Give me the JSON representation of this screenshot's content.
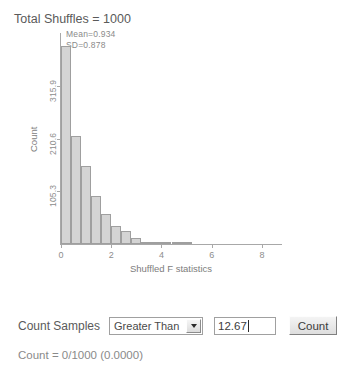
{
  "title": "Total Shuffles = 1000",
  "annotations": {
    "mean": "Mean=0.934",
    "sd": "SD=0.878"
  },
  "chart_data": {
    "type": "bar",
    "title": "Total Shuffles = 1000",
    "xlabel": "Shuffled F statistics",
    "ylabel": "Count",
    "xlim": [
      0,
      8.8
    ],
    "ylim": [
      0,
      421.2
    ],
    "grid": false,
    "legend": null,
    "xticks": [
      "0",
      "2",
      "4",
      "6",
      "8"
    ],
    "xtick_values": [
      0,
      2,
      4,
      6,
      8
    ],
    "yticks": [
      "105.3",
      "210.6",
      "315.9"
    ],
    "ytick_values": [
      105.3,
      210.6,
      315.9
    ],
    "bin_width": 0.4,
    "categories": [
      "0.0",
      "0.4",
      "0.8",
      "1.2",
      "1.6",
      "2.0",
      "2.4",
      "2.8",
      "3.2",
      "3.6",
      "4.0",
      "4.4",
      "4.8",
      "5.2",
      "5.6",
      "6.0"
    ],
    "values": [
      395,
      215,
      155,
      95,
      60,
      35,
      25,
      12,
      5,
      3,
      2,
      1,
      1,
      0,
      0,
      0
    ],
    "bar_fill": "#d4d4d4",
    "bar_border": "#9f9f9f"
  },
  "controls": {
    "count_samples_label": "Count Samples",
    "comparison": {
      "selected": "Greater Than",
      "options": [
        "Greater Than",
        "Less Than"
      ]
    },
    "threshold_value": "12.67",
    "count_button_label": "Count"
  },
  "result": "Count = 0/1000 (0.0000)"
}
